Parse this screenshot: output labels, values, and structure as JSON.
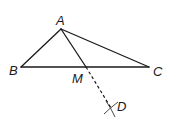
{
  "diagram": {
    "type": "geometry-construction",
    "points": {
      "A": {
        "label": "A",
        "x": 61,
        "y": 29
      },
      "B": {
        "label": "B",
        "x": 21,
        "y": 67
      },
      "C": {
        "label": "C",
        "x": 149,
        "y": 67
      },
      "M": {
        "label": "M",
        "x": 86,
        "y": 67
      },
      "D": {
        "label": "D",
        "x": 111,
        "y": 108
      }
    },
    "segments": [
      {
        "from": "A",
        "to": "B",
        "style": "solid"
      },
      {
        "from": "A",
        "to": "C",
        "style": "solid"
      },
      {
        "from": "B",
        "to": "C",
        "style": "solid"
      },
      {
        "from": "A",
        "to": "M",
        "style": "solid"
      },
      {
        "from": "M",
        "to": "D",
        "style": "dashed"
      }
    ],
    "construction_marks": [
      {
        "at": "D",
        "kind": "intersecting-arcs"
      }
    ],
    "colors": {
      "stroke": "#1a1a1a",
      "background": "#ffffff"
    }
  }
}
